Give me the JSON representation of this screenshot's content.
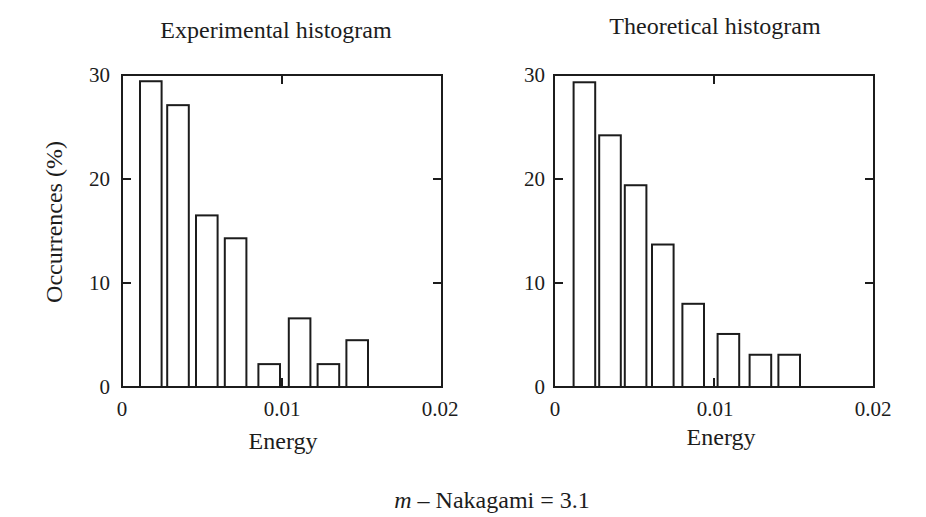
{
  "figure": {
    "ink_color": "#1c1c1c",
    "background": "#ffffff",
    "caption_var": "m",
    "caption_rest": " – Nakagami = 3.1"
  },
  "chart_data": [
    {
      "type": "bar",
      "title": "Experimental histogram",
      "xlabel": "Energy",
      "ylabel": "Occurrences (%)",
      "xlim": [
        0,
        0.02
      ],
      "ylim": [
        0,
        30
      ],
      "grid": false,
      "x_ticks": [
        0,
        0.01,
        0.02
      ],
      "x_tick_labels": [
        "0",
        "0.01",
        "0.02"
      ],
      "y_ticks": [
        0,
        10,
        20,
        30
      ],
      "y_tick_labels": [
        "0",
        "10",
        "20",
        "30"
      ],
      "bar_width": 0.00135,
      "bars": [
        {
          "x": 0.0018,
          "value": 29.4
        },
        {
          "x": 0.0035,
          "value": 27.1
        },
        {
          "x": 0.0053,
          "value": 16.5
        },
        {
          "x": 0.0071,
          "value": 14.3
        },
        {
          "x": 0.0092,
          "value": 2.2
        },
        {
          "x": 0.0111,
          "value": 6.6
        },
        {
          "x": 0.0129,
          "value": 2.2
        },
        {
          "x": 0.0147,
          "value": 4.5
        }
      ]
    },
    {
      "type": "bar",
      "title": "Theoretical histogram",
      "xlabel": "Energy",
      "xlim": [
        0,
        0.02
      ],
      "ylim": [
        0,
        30
      ],
      "grid": false,
      "x_ticks": [
        0,
        0.01,
        0.02
      ],
      "x_tick_labels": [
        "0",
        "0.01",
        "0.02"
      ],
      "y_ticks": [
        0,
        10,
        20,
        30
      ],
      "y_tick_labels": [
        "0",
        "10",
        "20",
        "30"
      ],
      "bar_width": 0.00135,
      "bars": [
        {
          "x": 0.0019,
          "value": 29.3
        },
        {
          "x": 0.0035,
          "value": 24.2
        },
        {
          "x": 0.0051,
          "value": 19.4
        },
        {
          "x": 0.0068,
          "value": 13.7
        },
        {
          "x": 0.0087,
          "value": 8.0
        },
        {
          "x": 0.0109,
          "value": 5.1
        },
        {
          "x": 0.0129,
          "value": 3.1
        },
        {
          "x": 0.0147,
          "value": 3.1
        }
      ]
    }
  ]
}
